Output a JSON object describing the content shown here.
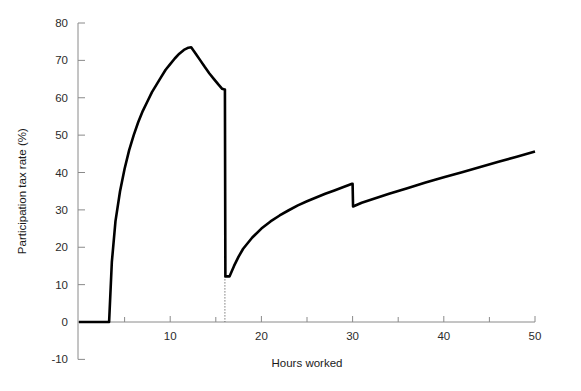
{
  "chart_data": {
    "type": "line",
    "title": "",
    "xlabel": "Hours worked",
    "ylabel": "Participation tax rate (%)",
    "xlim": [
      0,
      50
    ],
    "ylim": [
      -10,
      80
    ],
    "x_ticks_major": [
      10,
      20,
      30,
      40,
      50
    ],
    "x_tick_labels": [
      "10",
      "20",
      "30",
      "40",
      "50"
    ],
    "x_ticks_minor": [
      5,
      15,
      25,
      35,
      45
    ],
    "y_ticks": [
      -10,
      0,
      10,
      20,
      30,
      40,
      50,
      60,
      70,
      80
    ],
    "y_tick_labels": [
      "-10",
      "0",
      "10",
      "20",
      "30",
      "40",
      "50",
      "60",
      "70",
      "80"
    ],
    "grid": false,
    "legend": null,
    "line_color": "#000000",
    "series": [
      {
        "name": "Participation tax rate",
        "x": [
          0.0,
          1.0,
          2.0,
          3.0,
          3.3,
          3.6,
          4.0,
          4.5,
          5.0,
          5.5,
          6.0,
          6.5,
          7.0,
          7.5,
          8.0,
          8.5,
          9.0,
          9.5,
          10.0,
          10.5,
          11.0,
          11.5,
          12.0,
          12.3,
          12.8,
          13.3,
          13.8,
          14.3,
          14.8,
          15.3,
          15.7,
          15.95,
          16.0,
          16.05,
          16.5,
          17.0,
          17.5,
          18.0,
          19.0,
          20.0,
          21.0,
          22.0,
          23.0,
          24.0,
          25.0,
          26.0,
          27.0,
          28.0,
          29.0,
          29.95,
          30.0,
          30.05,
          31.0,
          32.0,
          34.0,
          36.0,
          38.0,
          40.0,
          42.0,
          44.0,
          46.0,
          48.0,
          50.0
        ],
        "y": [
          0.0,
          0.0,
          0.0,
          0.0,
          0.0,
          16.0,
          27.0,
          35.0,
          41.0,
          46.0,
          50.0,
          53.5,
          56.5,
          59.0,
          61.5,
          63.5,
          65.5,
          67.5,
          69.0,
          70.5,
          71.8,
          72.8,
          73.4,
          73.5,
          71.8,
          70.0,
          68.2,
          66.5,
          65.0,
          63.5,
          62.4,
          62.2,
          62.2,
          12.2,
          12.2,
          15.0,
          17.5,
          19.6,
          22.6,
          25.0,
          26.9,
          28.5,
          29.9,
          31.2,
          32.3,
          33.3,
          34.3,
          35.2,
          36.1,
          37.0,
          37.0,
          30.9,
          31.9,
          32.7,
          34.3,
          35.8,
          37.3,
          38.7,
          40.1,
          41.5,
          42.9,
          44.2,
          45.6
        ]
      }
    ],
    "annotations": [
      {
        "type": "vertical-dotted-guide",
        "x": 16,
        "y_from": 12.2,
        "y_to": 0,
        "note": "dotted drop guide at 16 hours"
      },
      {
        "type": "discontinuity",
        "x": 16,
        "from": 62.2,
        "to": 12.2
      },
      {
        "type": "discontinuity",
        "x": 30,
        "from": 37.0,
        "to": 30.9
      }
    ]
  },
  "caption": {
    "top_partial": "",
    "bottom_partial": ""
  }
}
